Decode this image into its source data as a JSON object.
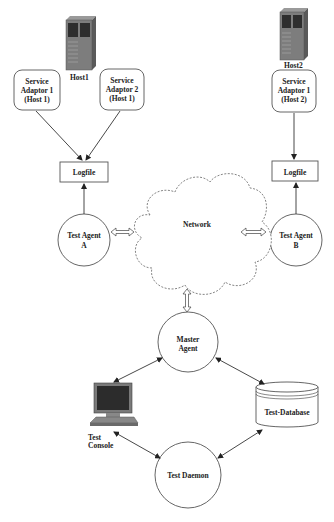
{
  "diagram": {
    "hosts": [
      {
        "id": "host1",
        "label": "Host1",
        "icon": "server-tower-icon"
      },
      {
        "id": "host2",
        "label": "Host2",
        "icon": "server-tower-icon"
      }
    ],
    "service_adaptors": [
      {
        "id": "sa1h1",
        "line1": "Service",
        "line2": "Adaptor 1",
        "line3": "(Host 1)"
      },
      {
        "id": "sa2h1",
        "line1": "Service",
        "line2": "Adaptor 2",
        "line3": "(Host 1)"
      },
      {
        "id": "sa1h2",
        "line1": "Service",
        "line2": "Adaptor 1",
        "line3": "(Host 2)"
      }
    ],
    "logfiles": [
      {
        "id": "log1",
        "label": "Logfile"
      },
      {
        "id": "log2",
        "label": "Logfile"
      }
    ],
    "agents": [
      {
        "id": "agentA",
        "line1": "Test Agent",
        "line2": "A"
      },
      {
        "id": "agentB",
        "line1": "Test Agent",
        "line2": "B"
      }
    ],
    "network": {
      "label": "Network"
    },
    "master_agent": {
      "line1": "Master",
      "line2": "Agent"
    },
    "test_database": {
      "label": "Test-Database"
    },
    "test_console": {
      "line1": "Test",
      "line2": "Console",
      "icon": "desktop-computer-icon"
    },
    "test_daemon": {
      "label": "Test Daemon"
    },
    "edges": [
      {
        "from": "sa1h1",
        "to": "log1",
        "type": "arrow"
      },
      {
        "from": "sa2h1",
        "to": "log1",
        "type": "arrow"
      },
      {
        "from": "sa1h2",
        "to": "log2",
        "type": "arrow"
      },
      {
        "from": "agentA",
        "to": "log1",
        "type": "arrow"
      },
      {
        "from": "agentB",
        "to": "log2",
        "type": "arrow"
      },
      {
        "from": "agentA",
        "to": "network",
        "type": "double-hollow-arrow"
      },
      {
        "from": "agentB",
        "to": "network",
        "type": "double-hollow-arrow"
      },
      {
        "from": "network",
        "to": "master",
        "type": "double-hollow-arrow"
      },
      {
        "from": "master",
        "to": "console",
        "type": "bidirectional"
      },
      {
        "from": "master",
        "to": "database",
        "type": "bidirectional"
      },
      {
        "from": "console",
        "to": "daemon",
        "type": "bidirectional"
      },
      {
        "from": "database",
        "to": "daemon",
        "type": "bidirectional"
      }
    ],
    "colors": {
      "line": "#333333",
      "node_stroke": "#555555",
      "server": "#6a6a6a",
      "screen": "#2a2a2a"
    }
  }
}
